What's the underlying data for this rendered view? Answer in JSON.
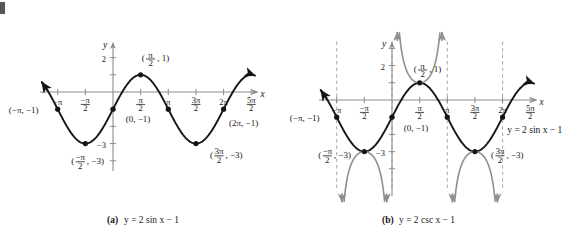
{
  "figure": {
    "panels": [
      {
        "tag": "(a)",
        "caption": "y = 2 sin x − 1",
        "equation": "y = 2 sin x − 1",
        "axis_x_label": "x",
        "axis_y_label": "y",
        "y_ticks": [
          {
            "label": "2",
            "value": 2
          },
          {
            "label": "−3",
            "value": -3
          }
        ],
        "x_ticks": [
          {
            "label": "−π",
            "value": -3.14159
          },
          {
            "label": "−π/2",
            "num": "−π",
            "den": "2",
            "value": -1.5708
          },
          {
            "label": "π/2",
            "num": "π",
            "den": "2",
            "value": 1.5708
          },
          {
            "label": "π",
            "value": 3.14159
          },
          {
            "label": "3π/2",
            "num": "3π",
            "den": "2",
            "value": 4.71239
          },
          {
            "label": "2π",
            "value": 6.28319
          },
          {
            "label": "5π/2",
            "num": "5π",
            "den": "2",
            "value": 7.85398
          }
        ],
        "points": [
          {
            "label": "(−π, −1)",
            "x": -3.14159,
            "y": -1
          },
          {
            "label": "(−π/2, −3)",
            "x": -1.5708,
            "y": -3
          },
          {
            "label": "(0, −1)",
            "x": 0,
            "y": -1
          },
          {
            "label": "(π/2, 1)",
            "x": 1.5708,
            "y": 1
          },
          {
            "label": "(π, −1)",
            "x": 3.14159,
            "y": -1
          },
          {
            "label": "(3π/2, −3)",
            "x": 4.71239,
            "y": -3
          },
          {
            "label": "(2π, −1)",
            "x": 6.28319,
            "y": -1
          }
        ]
      },
      {
        "tag": "(b)",
        "caption": "y = 2 csc x − 1",
        "equation": "y = 2 csc x − 1",
        "axis_x_label": "x",
        "axis_y_label": "y",
        "sine_curve_label": "y = 2 sin x − 1",
        "asymptotes": [
          {
            "label": "x = −π",
            "value": -3.14159
          },
          {
            "label": "x = 0",
            "value": 0
          },
          {
            "label": "x = π",
            "value": 3.14159
          },
          {
            "label": "x = 2π",
            "value": 6.28319
          }
        ],
        "y_ticks": [
          {
            "label": "2",
            "value": 2
          },
          {
            "label": "−3",
            "value": -3
          }
        ],
        "x_ticks": [
          {
            "label": "−π",
            "value": -3.14159
          },
          {
            "label": "−π/2",
            "num": "−π",
            "den": "2",
            "value": -1.5708
          },
          {
            "label": "π/2",
            "num": "π",
            "den": "2",
            "value": 1.5708
          },
          {
            "label": "π",
            "value": 3.14159
          },
          {
            "label": "3π/2",
            "num": "3π",
            "den": "2",
            "value": 4.71239
          },
          {
            "label": "2π",
            "value": 6.28319
          },
          {
            "label": "5π/2",
            "num": "5π",
            "den": "2",
            "value": 7.85398
          }
        ],
        "points": [
          {
            "label": "(−π, −1)",
            "x": -3.14159,
            "y": -1
          },
          {
            "label": "(−π/2, −3)",
            "x": -1.5708,
            "y": -3
          },
          {
            "label": "(0, −1)",
            "x": 0,
            "y": -1
          },
          {
            "label": "(π/2, 1)",
            "x": 1.5708,
            "y": 1
          },
          {
            "label": "(π, −1)",
            "x": 3.14159,
            "y": -1
          },
          {
            "label": "(3π/2, −3)",
            "x": 4.71239,
            "y": -3
          },
          {
            "label": "(2π, −1)",
            "x": 6.28319,
            "y": -1
          }
        ]
      }
    ],
    "colors": {
      "sine_curve": "#151515",
      "cosecant_curve": "#8f8f8f",
      "axis": "#8c8c8c",
      "asymptote": "#a8a8a8",
      "text": "#161616",
      "background": "#ffffff"
    }
  },
  "chart_data": {
    "type": "line",
    "title": "",
    "xlabel": "x",
    "ylabel": "y",
    "xlim": [
      -4.2,
      8.6
    ],
    "ylim": [
      -5.2,
      3.6
    ],
    "grid": false,
    "legend": "none",
    "series": [
      {
        "name": "y = 2 sin x − 1",
        "panel": "(a)",
        "color": "#151515",
        "function": "2*sin(x)-1",
        "key_points": [
          {
            "x": -3.14159,
            "y": -1,
            "label": "(−π, −1)"
          },
          {
            "x": -1.5708,
            "y": -3,
            "label": "(−π/2, −3)"
          },
          {
            "x": 0,
            "y": -1,
            "label": "(0, −1)"
          },
          {
            "x": 1.5708,
            "y": 1,
            "label": "(π/2, 1)"
          },
          {
            "x": 3.14159,
            "y": -1,
            "label": "(π, −1)"
          },
          {
            "x": 4.71239,
            "y": -3,
            "label": "(3π/2, −3)"
          },
          {
            "x": 6.28319,
            "y": -1,
            "label": "(2π, −1)"
          }
        ]
      },
      {
        "name": "y = 2 csc x − 1",
        "panel": "(b)",
        "color": "#8f8f8f",
        "function": "2*csc(x)-1",
        "asymptotes_x": [
          -3.14159,
          0,
          3.14159,
          6.28319
        ],
        "key_points": [
          {
            "x": -1.5708,
            "y": -3,
            "label": "(−π/2, −3)"
          },
          {
            "x": 1.5708,
            "y": 1,
            "label": "(π/2, 1)"
          },
          {
            "x": 4.71239,
            "y": -3,
            "label": "(3π/2, −3)"
          }
        ]
      }
    ]
  }
}
